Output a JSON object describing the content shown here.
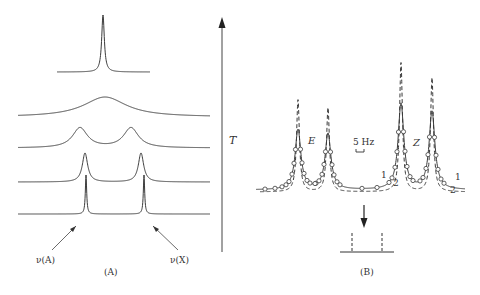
{
  "colors": {
    "stroke": "#3a3a3a",
    "background": "#ffffff"
  },
  "panel_a": {
    "caption": "(A)",
    "axis_label": "T",
    "left_arrow_label": "ν(A)",
    "right_arrow_label": "ν(X)",
    "traces": [
      {
        "id": "coalesced-sharp",
        "baseline_y": 72,
        "x_start": 57,
        "x_end": 150,
        "peaks": [
          {
            "x": 103,
            "top": 15,
            "w": 1.6
          }
        ]
      },
      {
        "id": "coalesced-broad",
        "baseline_y": 117,
        "x_start": 18,
        "x_end": 210,
        "peaks": [
          {
            "x": 105,
            "top": 97,
            "w": 26
          }
        ]
      },
      {
        "id": "near-coalescence",
        "baseline_y": 148,
        "x_start": 18,
        "x_end": 210,
        "peaks": [
          {
            "x": 80,
            "top": 128,
            "w": 9
          },
          {
            "x": 131,
            "top": 128,
            "w": 9
          }
        ]
      },
      {
        "id": "slow-exchange",
        "baseline_y": 182,
        "x_start": 18,
        "x_end": 210,
        "peaks": [
          {
            "x": 85,
            "top": 153,
            "w": 3.2
          },
          {
            "x": 141,
            "top": 153,
            "w": 3.2
          }
        ]
      },
      {
        "id": "no-exchange",
        "baseline_y": 214,
        "x_start": 18,
        "x_end": 210,
        "peaks": [
          {
            "x": 86,
            "top": 175,
            "w": 0.8
          },
          {
            "x": 144,
            "top": 175,
            "w": 0.8
          }
        ]
      }
    ]
  },
  "panel_b": {
    "caption": "(B)",
    "scale_label": "5 Hz",
    "isomer_labels": {
      "E": "E",
      "Z": "Z"
    },
    "curve_labels": {
      "left_1": "1",
      "left_2": "2",
      "right_1": "1",
      "right_2": "2"
    },
    "baseline_y": 190,
    "x_start": 256,
    "x_end": 465,
    "solid_peaks": [
      {
        "x": 298,
        "top": 130,
        "w": 3.5
      },
      {
        "x": 328,
        "top": 134,
        "w": 3.5
      },
      {
        "x": 401,
        "top": 104,
        "w": 3.5
      },
      {
        "x": 432,
        "top": 112,
        "w": 3.5
      }
    ],
    "dashed_peaks": [
      {
        "x": 298,
        "top": 100,
        "w": 1.8
      },
      {
        "x": 328,
        "top": 108,
        "w": 1.8
      },
      {
        "x": 401,
        "top": 63,
        "w": 1.8
      },
      {
        "x": 432,
        "top": 78,
        "w": 1.8
      }
    ]
  }
}
